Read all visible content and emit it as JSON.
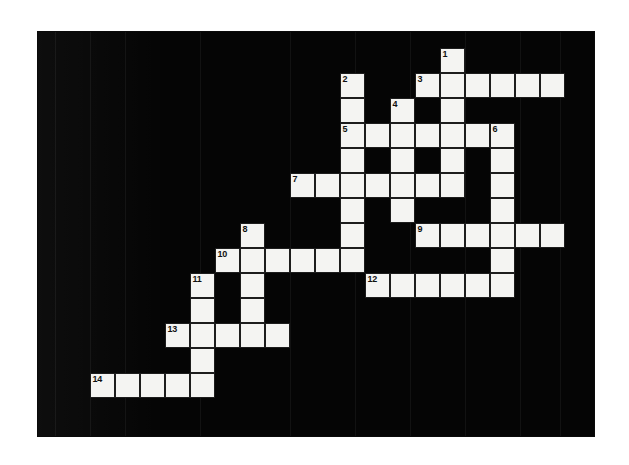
{
  "document": {
    "type": "crossword-puzzle",
    "title": "Crossword Puzzle Grid",
    "background_color": "#ffffff",
    "panel_color": "#050505",
    "cell_color": "#f4f4f2",
    "cell_border_color": "#1d1d1d",
    "number_color": "#111111"
  },
  "panel": {
    "x": 38,
    "y": 32,
    "width": 556,
    "height": 404
  },
  "grid": {
    "cell_size": 25,
    "origin_x": 90,
    "origin_y": 48,
    "columns": 20,
    "rows": 15
  },
  "bands": [
    55,
    90,
    125,
    200,
    290,
    355,
    410,
    465,
    520,
    560
  ],
  "cells": [
    {
      "c": 14,
      "r": 0,
      "n": "1"
    },
    {
      "c": 10,
      "r": 1,
      "n": "2"
    },
    {
      "c": 13,
      "r": 1,
      "n": "3"
    },
    {
      "c": 14,
      "r": 1,
      "n": ""
    },
    {
      "c": 15,
      "r": 1,
      "n": ""
    },
    {
      "c": 16,
      "r": 1,
      "n": ""
    },
    {
      "c": 17,
      "r": 1,
      "n": ""
    },
    {
      "c": 18,
      "r": 1,
      "n": ""
    },
    {
      "c": 10,
      "r": 2,
      "n": ""
    },
    {
      "c": 12,
      "r": 2,
      "n": "4"
    },
    {
      "c": 14,
      "r": 2,
      "n": ""
    },
    {
      "c": 10,
      "r": 3,
      "n": "5"
    },
    {
      "c": 11,
      "r": 3,
      "n": ""
    },
    {
      "c": 12,
      "r": 3,
      "n": ""
    },
    {
      "c": 13,
      "r": 3,
      "n": ""
    },
    {
      "c": 14,
      "r": 3,
      "n": ""
    },
    {
      "c": 15,
      "r": 3,
      "n": ""
    },
    {
      "c": 16,
      "r": 3,
      "n": "6"
    },
    {
      "c": 10,
      "r": 4,
      "n": ""
    },
    {
      "c": 12,
      "r": 4,
      "n": ""
    },
    {
      "c": 14,
      "r": 4,
      "n": ""
    },
    {
      "c": 16,
      "r": 4,
      "n": ""
    },
    {
      "c": 8,
      "r": 5,
      "n": "7"
    },
    {
      "c": 9,
      "r": 5,
      "n": ""
    },
    {
      "c": 10,
      "r": 5,
      "n": ""
    },
    {
      "c": 11,
      "r": 5,
      "n": ""
    },
    {
      "c": 12,
      "r": 5,
      "n": ""
    },
    {
      "c": 13,
      "r": 5,
      "n": ""
    },
    {
      "c": 14,
      "r": 5,
      "n": ""
    },
    {
      "c": 16,
      "r": 5,
      "n": ""
    },
    {
      "c": 10,
      "r": 6,
      "n": ""
    },
    {
      "c": 12,
      "r": 6,
      "n": ""
    },
    {
      "c": 16,
      "r": 6,
      "n": ""
    },
    {
      "c": 6,
      "r": 7,
      "n": "8"
    },
    {
      "c": 10,
      "r": 7,
      "n": ""
    },
    {
      "c": 13,
      "r": 7,
      "n": "9"
    },
    {
      "c": 14,
      "r": 7,
      "n": ""
    },
    {
      "c": 15,
      "r": 7,
      "n": ""
    },
    {
      "c": 16,
      "r": 7,
      "n": ""
    },
    {
      "c": 17,
      "r": 7,
      "n": ""
    },
    {
      "c": 18,
      "r": 7,
      "n": ""
    },
    {
      "c": 5,
      "r": 8,
      "n": "10"
    },
    {
      "c": 6,
      "r": 8,
      "n": ""
    },
    {
      "c": 7,
      "r": 8,
      "n": ""
    },
    {
      "c": 8,
      "r": 8,
      "n": ""
    },
    {
      "c": 9,
      "r": 8,
      "n": ""
    },
    {
      "c": 10,
      "r": 8,
      "n": ""
    },
    {
      "c": 16,
      "r": 8,
      "n": ""
    },
    {
      "c": 4,
      "r": 9,
      "n": "11"
    },
    {
      "c": 6,
      "r": 9,
      "n": ""
    },
    {
      "c": 11,
      "r": 9,
      "n": "12"
    },
    {
      "c": 12,
      "r": 9,
      "n": ""
    },
    {
      "c": 13,
      "r": 9,
      "n": ""
    },
    {
      "c": 14,
      "r": 9,
      "n": ""
    },
    {
      "c": 15,
      "r": 9,
      "n": ""
    },
    {
      "c": 16,
      "r": 9,
      "n": ""
    },
    {
      "c": 4,
      "r": 10,
      "n": ""
    },
    {
      "c": 6,
      "r": 10,
      "n": ""
    },
    {
      "c": 3,
      "r": 11,
      "n": "13"
    },
    {
      "c": 4,
      "r": 11,
      "n": ""
    },
    {
      "c": 5,
      "r": 11,
      "n": ""
    },
    {
      "c": 6,
      "r": 11,
      "n": ""
    },
    {
      "c": 7,
      "r": 11,
      "n": ""
    },
    {
      "c": 4,
      "r": 12,
      "n": ""
    },
    {
      "c": 0,
      "r": 13,
      "n": "14"
    },
    {
      "c": 1,
      "r": 13,
      "n": ""
    },
    {
      "c": 2,
      "r": 13,
      "n": ""
    },
    {
      "c": 3,
      "r": 13,
      "n": ""
    },
    {
      "c": 4,
      "r": 13,
      "n": ""
    }
  ],
  "clue_numbers": [
    "1",
    "2",
    "3",
    "4",
    "5",
    "6",
    "7",
    "8",
    "9",
    "10",
    "11",
    "12",
    "13",
    "14"
  ]
}
